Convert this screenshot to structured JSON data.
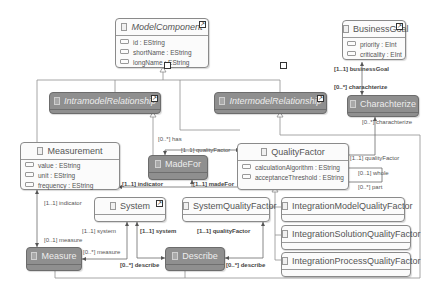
{
  "diagram": {
    "classes": {
      "model_component": {
        "name": "ModelComponent",
        "abstract": true,
        "attributes": [
          "id : EString",
          "shortName : EString",
          "longName : EString"
        ]
      },
      "business_goal": {
        "name": "BusinessGoal",
        "attributes": [
          "priority : EInt",
          "criticality : EInt"
        ]
      },
      "intramodel_relationship": {
        "name": "IntramodelRelationship",
        "abstract": true
      },
      "intermodel_relationship": {
        "name": "IntermodelRelationship",
        "abstract": true
      },
      "charachterize": {
        "name": "Charachterize"
      },
      "measurement": {
        "name": "Measurement",
        "attributes": [
          "value : EString",
          "unit : EString",
          "frequency : EString"
        ]
      },
      "made_for": {
        "name": "MadeFor"
      },
      "quality_factor": {
        "name": "QualityFactor",
        "attributes": [
          "calculationAlgorithm : EString",
          "acceptanceThreshold : EString"
        ]
      },
      "system": {
        "name": "System"
      },
      "system_quality_factor": {
        "name": "SystemQualityFactor"
      },
      "integration_model_qf": {
        "name": "IntegrationModelQualityFactor"
      },
      "integration_solution_qf": {
        "name": "IntegrationSolutionQualityFactor"
      },
      "integration_process_qf": {
        "name": "IntegrationProcessQualityFactor"
      },
      "measure": {
        "name": "Measure"
      },
      "describe": {
        "name": "Describe"
      }
    },
    "edge_labels": {
      "business_goal": "[1..1] businessGoal",
      "charachterize_top": "[0..*] charachterize",
      "charachterize_bottom": "[0..*] charachterize",
      "has": "[0..*] has",
      "quality_factor_madefor": "[1..1] qualityFactor",
      "quality_factor_char": "[1..1] qualityFactor",
      "whole": "[0..1] whole",
      "part": "[0..*] part",
      "indicator_madefor": "[1..1] indicator",
      "made_for": "[1..1] madeFor",
      "indicator_measure": "[1..1] indicator",
      "measure_label": "[0..1] measure",
      "system_measure": "[1..1] system",
      "measure_system": "[0..*] measure",
      "system_describe": "[1..1] system",
      "quality_factor_describe": "[1..1] qualityFactor",
      "describe_left": "[0..*] describe",
      "describe_right": "[0..*] describe"
    },
    "colors": {
      "concrete_fill": "#fbfbfb",
      "relationship_fill": "#8f8f8f",
      "line": "#8a8a8a"
    }
  }
}
